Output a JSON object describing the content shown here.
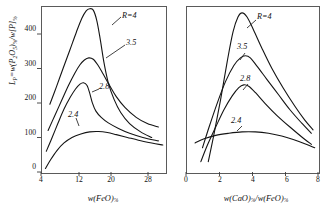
{
  "figure": {
    "background": "#ffffff",
    "line_color": "#1a1a1a",
    "frame_color": "#5a5a5a"
  },
  "axis_titles": {
    "y_axis_full": "LP = w(P2O5)% / w[P]%",
    "y_prefix_italic": "L",
    "y_prefix_sub": "P",
    "y_equals": "=",
    "y_num_w": "w",
    "y_num_open": "(P",
    "y_num_sub1": "2",
    "y_num_O": "O",
    "y_num_sub2": "5",
    "y_num_close": ")",
    "y_num_pct": "%",
    "y_slash": "/",
    "y_den_w": "w",
    "y_den_brk": "[P]",
    "y_den_pct": "%",
    "left_x_full": "w(FeO)%",
    "right_x_full": "w(CaO)% / w(FeO)%"
  },
  "chart_data": [
    {
      "type": "line",
      "panel": "left",
      "title": "",
      "xlabel": "w(FeO)%",
      "ylabel": "LP = w(P2O5)%/w[P]%",
      "xlim": [
        4,
        32
      ],
      "ylim": [
        0,
        480
      ],
      "xticks": [
        4,
        12,
        20,
        28
      ],
      "xtick_labels": [
        "4",
        "12",
        "20",
        "28"
      ],
      "yticks": [
        0,
        100,
        200,
        300,
        400
      ],
      "ytick_labels": [
        "0",
        "100",
        "200",
        "300",
        "400"
      ],
      "grid": false,
      "legend": "inline-curve-labels",
      "series": [
        {
          "name": "R=4",
          "label": "R=4",
          "label_prefix_italic": "R",
          "label_rest": "=4",
          "points": [
            [
              6.0,
              196
            ],
            [
              7.5,
              247
            ],
            [
              9.0,
              300
            ],
            [
              10.5,
              352
            ],
            [
              12.0,
              405
            ],
            [
              13.2,
              444
            ],
            [
              14.2,
              466
            ],
            [
              15.0,
              472
            ],
            [
              15.8,
              468
            ],
            [
              16.6,
              438
            ],
            [
              17.4,
              382
            ],
            [
              18.2,
              318
            ],
            [
              19.2,
              258
            ],
            [
              20.5,
              210
            ],
            [
              22.0,
              172
            ],
            [
              24.0,
              140
            ],
            [
              26.5,
              116
            ],
            [
              29.0,
              100
            ]
          ]
        },
        {
          "name": "3.5",
          "label": "3.5",
          "points": [
            [
              5.6,
              120
            ],
            [
              7.0,
              160
            ],
            [
              8.6,
              205
            ],
            [
              10.2,
              250
            ],
            [
              11.6,
              285
            ],
            [
              12.8,
              310
            ],
            [
              13.8,
              324
            ],
            [
              14.8,
              330
            ],
            [
              15.8,
              326
            ],
            [
              16.8,
              310
            ],
            [
              18.0,
              284
            ],
            [
              19.5,
              250
            ],
            [
              21.0,
              218
            ],
            [
              23.0,
              186
            ],
            [
              25.5,
              158
            ],
            [
              28.0,
              140
            ],
            [
              30.5,
              130
            ]
          ]
        },
        {
          "name": "2.8",
          "label": "2.8",
          "points": [
            [
              5.2,
              60
            ],
            [
              6.4,
              96
            ],
            [
              7.8,
              140
            ],
            [
              9.2,
              182
            ],
            [
              10.6,
              216
            ],
            [
              11.8,
              240
            ],
            [
              12.8,
              254
            ],
            [
              13.6,
              258
            ],
            [
              14.4,
              250
            ],
            [
              15.0,
              228
            ],
            [
              15.6,
              200
            ],
            [
              16.4,
              176
            ],
            [
              17.6,
              158
            ],
            [
              19.2,
              142
            ],
            [
              21.5,
              126
            ],
            [
              24.0,
              112
            ],
            [
              27.0,
              100
            ],
            [
              30.5,
              90
            ]
          ]
        },
        {
          "name": "2.4",
          "label": "2.4",
          "points": [
            [
              5.0,
              10
            ],
            [
              6.2,
              36
            ],
            [
              7.6,
              62
            ],
            [
              9.2,
              84
            ],
            [
              11.0,
              100
            ],
            [
              13.0,
              110
            ],
            [
              15.0,
              116
            ],
            [
              17.0,
              117
            ],
            [
              19.0,
              114
            ],
            [
              21.0,
              108
            ],
            [
              23.5,
              100
            ],
            [
              26.0,
              92
            ],
            [
              29.0,
              84
            ],
            [
              31.5,
              78
            ]
          ]
        }
      ]
    },
    {
      "type": "line",
      "panel": "right",
      "title": "",
      "xlabel": "w(CaO)%/w(FeO)%",
      "ylabel": "LP = w(P2O5)%/w[P]%",
      "xlim": [
        0,
        8
      ],
      "ylim": [
        0,
        480
      ],
      "xticks": [
        0,
        2,
        4,
        6,
        8
      ],
      "xtick_labels": [
        "0",
        "2",
        "4",
        "6",
        "8"
      ],
      "yticks": [
        0,
        100,
        200,
        300,
        400
      ],
      "ytick_labels": [
        "0",
        "100",
        "200",
        "300",
        "400"
      ],
      "grid": false,
      "legend": "inline-curve-labels",
      "series": [
        {
          "name": "R=4",
          "label": "R=4",
          "label_prefix_italic": "R",
          "label_rest": "=4",
          "points": [
            [
              1.35,
              30
            ],
            [
              1.7,
              110
            ],
            [
              2.1,
              210
            ],
            [
              2.5,
              320
            ],
            [
              2.85,
              405
            ],
            [
              3.15,
              448
            ],
            [
              3.4,
              460
            ],
            [
              3.7,
              448
            ],
            [
              4.1,
              410
            ],
            [
              4.6,
              358
            ],
            [
              5.2,
              300
            ],
            [
              5.9,
              242
            ],
            [
              6.6,
              190
            ],
            [
              7.2,
              150
            ],
            [
              7.7,
              122
            ]
          ]
        },
        {
          "name": "3.5",
          "label": "3.5",
          "points": [
            [
              1.0,
              70
            ],
            [
              1.4,
              130
            ],
            [
              1.9,
              200
            ],
            [
              2.4,
              262
            ],
            [
              2.9,
              308
            ],
            [
              3.3,
              330
            ],
            [
              3.6,
              336
            ],
            [
              3.9,
              330
            ],
            [
              4.3,
              306
            ],
            [
              4.9,
              268
            ],
            [
              5.6,
              224
            ],
            [
              6.3,
              180
            ],
            [
              7.0,
              142
            ],
            [
              7.6,
              112
            ]
          ]
        },
        {
          "name": "2.8",
          "label": "2.8",
          "points": [
            [
              0.9,
              30
            ],
            [
              1.3,
              78
            ],
            [
              1.8,
              130
            ],
            [
              2.3,
              180
            ],
            [
              2.8,
              220
            ],
            [
              3.2,
              244
            ],
            [
              3.5,
              252
            ],
            [
              3.8,
              248
            ],
            [
              4.2,
              230
            ],
            [
              4.8,
              198
            ],
            [
              5.5,
              164
            ],
            [
              6.3,
              130
            ],
            [
              7.0,
              102
            ],
            [
              7.6,
              80
            ]
          ]
        },
        {
          "name": "2.4",
          "label": "2.4",
          "points": [
            [
              0.55,
              84
            ],
            [
              1.1,
              96
            ],
            [
              1.8,
              106
            ],
            [
              2.6,
              112
            ],
            [
              3.4,
              116
            ],
            [
              4.2,
              116
            ],
            [
              5.0,
              112
            ],
            [
              5.8,
              104
            ],
            [
              6.5,
              94
            ],
            [
              7.2,
              82
            ],
            [
              7.8,
              70
            ]
          ]
        }
      ]
    }
  ],
  "left_panel": {
    "curve_labels": [
      {
        "name": "R-4-label",
        "text": "R=4",
        "x": 122,
        "y": 14
      },
      {
        "name": "3-5-label",
        "text": "3.5",
        "x": 126,
        "y": 40
      },
      {
        "name": "2-8-label",
        "text": "2.8",
        "x": 99,
        "y": 86
      },
      {
        "name": "2-4-label",
        "text": "2.4",
        "x": 70,
        "y": 113
      }
    ]
  },
  "right_panel": {
    "curve_labels": [
      {
        "name": "R-4-label",
        "text": "R=4",
        "x": 257,
        "y": 15
      },
      {
        "name": "3-5-label",
        "text": "3.5",
        "x": 240,
        "y": 45
      },
      {
        "name": "2-8-label",
        "text": "2.8",
        "x": 242,
        "y": 77
      },
      {
        "name": "2-4-label",
        "text": "2.4",
        "x": 233,
        "y": 119
      }
    ]
  }
}
